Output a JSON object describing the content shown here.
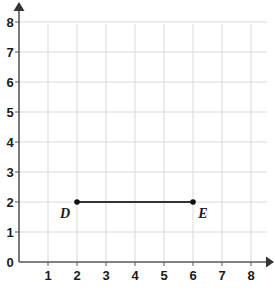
{
  "chart_data": {
    "type": "scatter",
    "title": "",
    "xlabel": "",
    "ylabel": "",
    "xlim": [
      0,
      8
    ],
    "ylim": [
      0,
      8
    ],
    "grid": true,
    "legend": false,
    "x_ticks": [
      "1",
      "2",
      "3",
      "4",
      "5",
      "6",
      "7",
      "8"
    ],
    "y_ticks": [
      "0",
      "1",
      "2",
      "3",
      "4",
      "5",
      "6",
      "7",
      "8"
    ],
    "origin_label": "0",
    "points": [
      {
        "label": "D",
        "x": 2,
        "y": 2
      },
      {
        "label": "E",
        "x": 6,
        "y": 2
      }
    ],
    "segments": [
      {
        "from": "D",
        "to": "E",
        "x1": 2,
        "y1": 2,
        "x2": 6,
        "y2": 2
      }
    ],
    "colors": {
      "grid": "#d9d9d9",
      "axis": "#595959",
      "segment": "#333333",
      "point": "#111111",
      "label": "#1a1a1a",
      "background": "#ffffff"
    }
  }
}
